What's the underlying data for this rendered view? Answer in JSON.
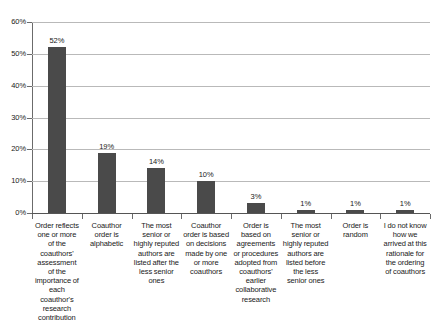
{
  "chart_data": {
    "type": "bar",
    "title": "",
    "subtitle": "",
    "xlabel": "",
    "ylabel": "",
    "ylim": [
      0,
      60
    ],
    "ytick_labels": [
      "0%",
      "10%",
      "20%",
      "30%",
      "40%",
      "50%",
      "60%"
    ],
    "ytick_values": [
      0,
      10,
      20,
      30,
      40,
      50,
      60
    ],
    "grid": true,
    "legend": false,
    "legend_position": "none",
    "orientation": "vertical",
    "bar_color": "#4a4a4a",
    "gridline_color": "#b9b9b9",
    "axis_color": "#555555",
    "background_color": "#ffffff",
    "categories": [
      "Order reflects one or more of the coauthors' assessment of the importance of each coauthor's research contribution",
      "Coauthor order is alphabetic",
      "The most senior or highly reputed authors are listed after the less senior ones",
      "Coauthor order is based on decisions made by one or more coauthors",
      "Order is based on agreements or procedures adopted from coauthors' earlier collaborative research",
      "The most senior or highly reputed authors are listed before the less senior ones",
      "Order is random",
      "I do not know how we arrived at this rationale for the ordering of coauthors"
    ],
    "values": [
      52,
      19,
      14,
      10,
      3,
      1,
      1,
      1
    ],
    "data_labels": [
      "52%",
      "19%",
      "14%",
      "10%",
      "3%",
      "1%",
      "1%",
      "1%"
    ]
  }
}
